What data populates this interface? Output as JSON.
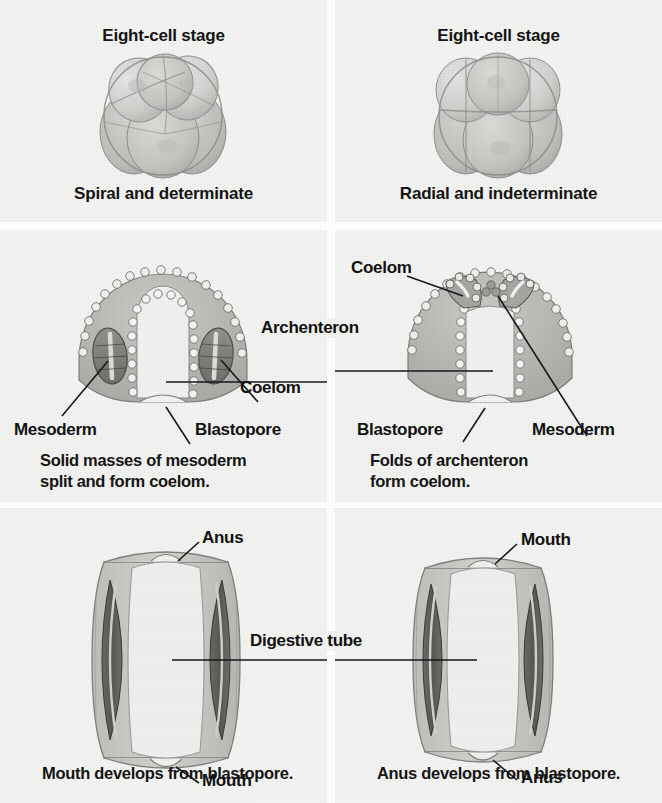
{
  "figure": {
    "columns": [
      "Protostome",
      "Deuterostome"
    ],
    "background_color": "#f2f2f0",
    "ink_color": "#141414"
  },
  "row1": {
    "left": {
      "heading": "Eight-cell stage",
      "subtitle": "Spiral and determinate",
      "embryo": "spiral-cleavage-embryo"
    },
    "right": {
      "heading": "Eight-cell stage",
      "subtitle": "Radial and indeterminate",
      "embryo": "radial-cleavage-embryo"
    }
  },
  "row2": {
    "shared_label": "Archenteron",
    "left": {
      "labels": [
        "Mesoderm",
        "Blastopore",
        "Coelom"
      ],
      "caption_line1": "Solid masses of mesoderm",
      "caption_line2": "split and form coelom.",
      "embryo": "protostome-gastrula"
    },
    "right": {
      "labels": [
        "Coelom",
        "Blastopore",
        "Mesoderm"
      ],
      "caption_line1": "Folds of archenteron",
      "caption_line2": "form coelom.",
      "embryo": "deuterostome-gastrula"
    }
  },
  "row3": {
    "shared_label": "Digestive tube",
    "left": {
      "top_label": "Anus",
      "bottom_label": "Mouth",
      "caption": "Mouth develops from blastopore.",
      "embryo": "protostome-worm"
    },
    "right": {
      "top_label": "Mouth",
      "bottom_label": "Anus",
      "caption": "Anus develops from blastopore.",
      "embryo": "deuterostome-worm"
    }
  }
}
